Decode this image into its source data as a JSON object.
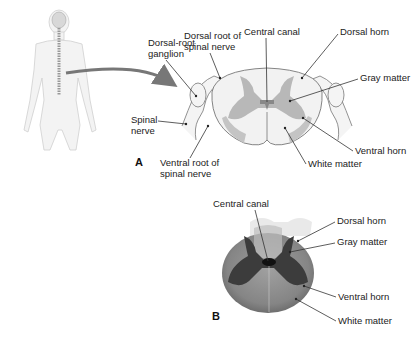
{
  "figure": {
    "panel_a": {
      "letter": "A",
      "labels": {
        "dorsal_root_ganglion": [
          "Dorsal-root",
          "ganglion"
        ],
        "dorsal_root": [
          "Dorsal root of",
          "spinal nerve"
        ],
        "central_canal": "Central canal",
        "dorsal_horn": "Dorsal horn",
        "gray_matter": "Gray matter",
        "spinal_nerve": [
          "Spinal",
          "nerve"
        ],
        "ventral_horn": "Ventral horn",
        "ventral_root": [
          "Ventral root of",
          "spinal nerve"
        ],
        "white_matter": "White matter"
      }
    },
    "panel_b": {
      "letter": "B",
      "labels": {
        "central_canal": "Central canal",
        "dorsal_horn": "Dorsal horn",
        "gray_matter": "Gray matter",
        "ventral_horn": "Ventral horn",
        "white_matter": "White matter"
      }
    },
    "colors": {
      "gray_matter_drawn": "#b8b8b8",
      "white_matter_drawn": "#f2f2f2",
      "photo_tissue": "#8a8a8a",
      "photo_gray": "#3a3a3a",
      "arrow": "#777777"
    }
  }
}
